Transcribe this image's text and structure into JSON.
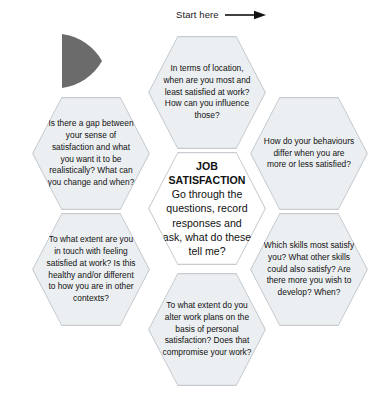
{
  "annotation": {
    "start_label": "Start here",
    "arrow_icon": "arrow-right-icon"
  },
  "wedge": {
    "icon": "pie-wedge-icon",
    "color": "#6b6b6b"
  },
  "colors": {
    "hex_fill": "#eceff1",
    "hex_center_fill": "#ffffff",
    "hex_stroke": "#c8ccd0",
    "text": "#111111",
    "background": "#ffffff"
  },
  "center": {
    "title": "JOB SATISFACTION",
    "body": "Go through the questions, record responses and ask, what do these tell me?"
  },
  "hexagons": [
    {
      "id": "top",
      "text": "In terms of location, when are you most and least satisfied at work? How can you influence those?"
    },
    {
      "id": "right",
      "text": "How do your behaviours differ when you are more or less satisfied?"
    },
    {
      "id": "bottomright",
      "text": "Which skills most satisfy you? What other skills could also satisfy? Are there more you wish to develop? When?"
    },
    {
      "id": "bottom",
      "text": "To what extent do you alter work plans on the basis of personal satisfaction? Does that compromise your work?"
    },
    {
      "id": "bottomleft",
      "text": "To what extent are you in touch with feeling satisfied at work? Is this healthy and/or different to how you are in other contexts?"
    },
    {
      "id": "left",
      "text": "Is there a gap between your sense of satisfaction and what you want it to be realistically? What can you change and when?"
    }
  ]
}
